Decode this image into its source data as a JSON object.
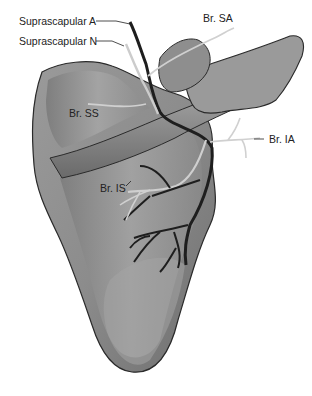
{
  "figure": {
    "labels": {
      "suprascapular_a": "Suprascapular A",
      "suprascapular_n": "Suprascapular N",
      "br_sa": "Br. SA",
      "br_ss": "Br. SS",
      "br_is": "Br. IS",
      "br_ia": "Br. IA"
    },
    "colors": {
      "bone_fill": "#8a8a8a",
      "bone_light": "#b4b4b4",
      "bone_dark": "#555555",
      "outline": "#2a2a2a",
      "artery": "#1e1e1e",
      "nerve": "#c8c8c8",
      "label_text": "#222222"
    }
  }
}
